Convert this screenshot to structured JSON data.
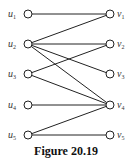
{
  "caption": "Figure 20.19",
  "left_nodes": [
    {
      "id": "u1",
      "label": "u",
      "sub": "1",
      "y": 14
    },
    {
      "id": "u2",
      "label": "u",
      "sub": "2",
      "y": 44
    },
    {
      "id": "u3",
      "label": "u",
      "sub": "3",
      "y": 74
    },
    {
      "id": "u4",
      "label": "u",
      "sub": "4",
      "y": 105
    },
    {
      "id": "u5",
      "label": "u",
      "sub": "5",
      "y": 135
    }
  ],
  "right_nodes": [
    {
      "id": "v1",
      "label": "v",
      "sub": "1",
      "y": 14
    },
    {
      "id": "v2",
      "label": "v",
      "sub": "2",
      "y": 44
    },
    {
      "id": "v3",
      "label": "v",
      "sub": "3",
      "y": 74
    },
    {
      "id": "v4",
      "label": "v",
      "sub": "4",
      "y": 105
    },
    {
      "id": "v5",
      "label": "v",
      "sub": "5",
      "y": 135
    }
  ],
  "edges": [
    [
      "u1",
      "v1"
    ],
    [
      "u2",
      "v1"
    ],
    [
      "u2",
      "v2"
    ],
    [
      "u2",
      "v3"
    ],
    [
      "u2",
      "v4"
    ],
    [
      "u3",
      "v2"
    ],
    [
      "u3",
      "v4"
    ],
    [
      "u4",
      "v4"
    ],
    [
      "u5",
      "v4"
    ],
    [
      "u5",
      "v5"
    ]
  ]
}
